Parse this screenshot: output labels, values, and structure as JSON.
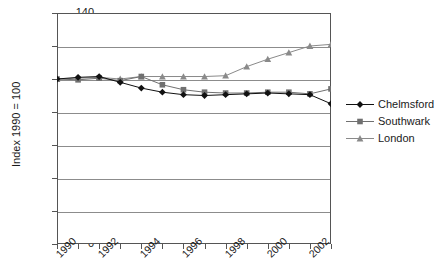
{
  "chart_data": {
    "type": "line",
    "title": "",
    "xlabel": "",
    "ylabel": "Index 1990 = 100",
    "xlim": [
      1990,
      2003
    ],
    "ylim": [
      0,
      140
    ],
    "ytick_step": 20,
    "yticks": [
      0,
      20,
      40,
      60,
      80,
      100,
      120,
      140
    ],
    "xticks": [
      1990,
      1991,
      1992,
      1993,
      1994,
      1995,
      1996,
      1997,
      1998,
      1999,
      2000,
      2001,
      2002,
      2003
    ],
    "xtick_labels": [
      "1990",
      "1992",
      "1994",
      "1996",
      "1998",
      "2000",
      "2002"
    ],
    "xtick_labels_years": [
      1990,
      1992,
      1994,
      1996,
      1998,
      2000,
      2002
    ],
    "grid": true,
    "legend_position": "right",
    "x": [
      1990,
      1991,
      1992,
      1993,
      1994,
      1995,
      1996,
      1997,
      1998,
      1999,
      2000,
      2001,
      2002,
      2003
    ],
    "series": [
      {
        "name": "Chelmsford",
        "marker": "diamond",
        "color": "#111111",
        "values": [
          100,
          101,
          101.5,
          98,
          94.5,
          92,
          90.5,
          90,
          90.5,
          91,
          91.5,
          91,
          90.5,
          85
        ]
      },
      {
        "name": "Southwark",
        "marker": "square",
        "color": "#707070",
        "values": [
          100,
          99.5,
          100.5,
          99,
          101.5,
          96.5,
          93.5,
          92,
          91.5,
          91.5,
          92,
          92,
          91,
          94
        ]
      },
      {
        "name": "London",
        "marker": "triangle",
        "color": "#8a8a8a",
        "values": [
          100,
          100.5,
          101,
          100,
          101.5,
          101.5,
          101.5,
          101.5,
          102,
          107.5,
          112,
          116,
          120,
          121
        ]
      }
    ]
  },
  "legend": {
    "items": [
      {
        "label": "Chelmsford"
      },
      {
        "label": "Southwark"
      },
      {
        "label": "London"
      }
    ]
  },
  "axes": {
    "y_title": "Index 1990 = 100"
  }
}
